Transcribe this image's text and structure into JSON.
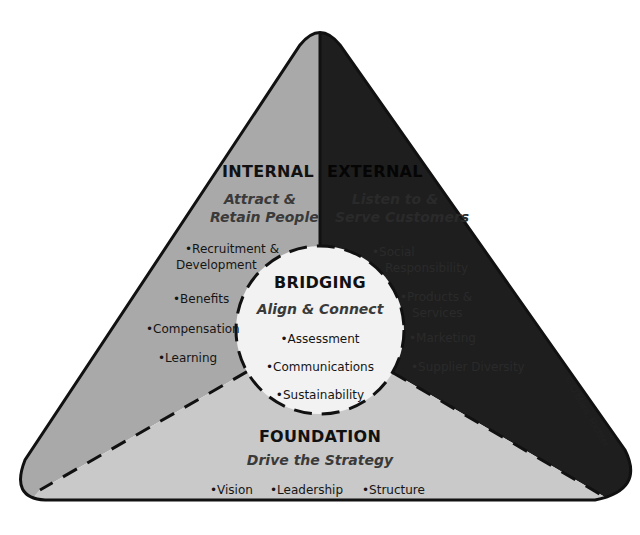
{
  "diagram": {
    "colors": {
      "internal": "#a9a9a9",
      "external": "#1e1e1e",
      "foundation": "#c9c9c9",
      "bridging": "#f2f2f2",
      "outline": "#111111"
    },
    "internal": {
      "title": "INTERNAL",
      "subtitle_line1": "Attract &",
      "subtitle_line2": "Retain People",
      "items": [
        "•Recruitment &",
        "Development",
        "•Benefits",
        "•Compensation",
        "•Learning"
      ]
    },
    "external": {
      "title": "EXTERNAL",
      "subtitle_line1": "Listen to &",
      "subtitle_line2": "Serve Customers",
      "items": [
        "•Social",
        "Responsibility",
        "•Products &",
        "Services",
        "•Marketing",
        "•Supplier Diversity"
      ]
    },
    "bridging": {
      "title": "BRIDGING",
      "subtitle": "Align & Connect",
      "items": [
        "•Assessment",
        "•Communications",
        "•Sustainability"
      ]
    },
    "foundation": {
      "title": "FOUNDATION",
      "subtitle": "Drive the Strategy",
      "items": [
        "•Vision",
        "•Leadership",
        "•Structure"
      ]
    },
    "copyright": "© O'Mara, Richter"
  }
}
